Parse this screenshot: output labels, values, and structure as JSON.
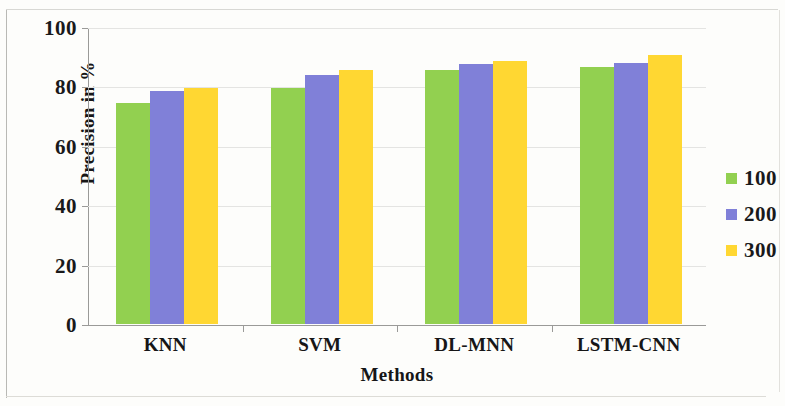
{
  "chart_data": {
    "type": "bar",
    "title": "",
    "xlabel": "Methods",
    "ylabel": "Precision in %",
    "categories": [
      "KNN",
      "SVM",
      "DL-MNN",
      "LSTM-CNN"
    ],
    "series": [
      {
        "name": "100",
        "color": "#92d050",
        "values": [
          74.5,
          79.5,
          85.5,
          86.5
        ]
      },
      {
        "name": "200",
        "color": "#8080d8",
        "values": [
          78.5,
          84.0,
          87.5,
          88.0
        ]
      },
      {
        "name": "300",
        "color": "#ffd732",
        "values": [
          79.5,
          85.5,
          88.5,
          90.5
        ]
      }
    ],
    "ylim": [
      0,
      100
    ],
    "yticks": [
      0,
      20,
      40,
      60,
      80,
      100
    ],
    "ytick_labels": [
      "0",
      "20",
      "40",
      "60",
      "80",
      "100"
    ],
    "grid": "horizontal",
    "legend_position": "right",
    "legend_entries": [
      "100",
      "200",
      "300"
    ]
  }
}
